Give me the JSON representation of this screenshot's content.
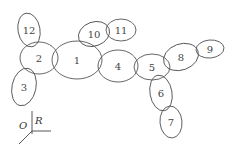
{
  "nodes": [
    {
      "id": "12",
      "label": "12",
      "cx": 29,
      "cy": 30,
      "rx": 11,
      "ry": 17,
      "rot": -10
    },
    {
      "id": "2",
      "label": "2",
      "cx": 39,
      "cy": 58,
      "rx": 19,
      "ry": 16,
      "rot": 0
    },
    {
      "id": "3",
      "label": "3",
      "cx": 24,
      "cy": 87,
      "rx": 12,
      "ry": 19,
      "rot": 12
    },
    {
      "id": "1",
      "label": "1",
      "cx": 77,
      "cy": 60,
      "rx": 25,
      "ry": 19,
      "rot": 0
    },
    {
      "id": "10",
      "label": "10",
      "cx": 94,
      "cy": 34,
      "rx": 16,
      "ry": 12,
      "rot": -20
    },
    {
      "id": "11",
      "label": "11",
      "cx": 121,
      "cy": 30,
      "rx": 15,
      "ry": 11,
      "rot": 0
    },
    {
      "id": "4",
      "label": "4",
      "cx": 118,
      "cy": 66,
      "rx": 20,
      "ry": 16,
      "rot": 0
    },
    {
      "id": "5",
      "label": "5",
      "cx": 152,
      "cy": 67,
      "rx": 18,
      "ry": 13,
      "rot": 0
    },
    {
      "id": "8",
      "label": "8",
      "cx": 181,
      "cy": 57,
      "rx": 18,
      "ry": 13,
      "rot": -20
    },
    {
      "id": "9",
      "label": "9",
      "cx": 210,
      "cy": 49,
      "rx": 14,
      "ry": 9,
      "rot": -5
    },
    {
      "id": "6",
      "label": "6",
      "cx": 161,
      "cy": 93,
      "rx": 11,
      "ry": 18,
      "rot": -10
    },
    {
      "id": "7",
      "label": "7",
      "cx": 171,
      "cy": 122,
      "rx": 11,
      "ry": 16,
      "rot": -5
    }
  ],
  "axes": {
    "origin_label": "O",
    "r_label": "R"
  }
}
